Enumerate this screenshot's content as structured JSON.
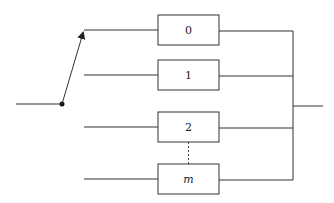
{
  "diagram": {
    "type": "switch-selected parallel blocks",
    "colors": {
      "line": "#333333",
      "background": "#ffffff"
    },
    "blocks": [
      {
        "label": "0",
        "italic": false
      },
      {
        "label": "1",
        "italic": false
      },
      {
        "label": "2",
        "italic": false
      },
      {
        "label": "m",
        "italic": true
      }
    ],
    "switch": {
      "connected_to": "0"
    },
    "ellipsis_between": [
      "2",
      "m"
    ]
  }
}
